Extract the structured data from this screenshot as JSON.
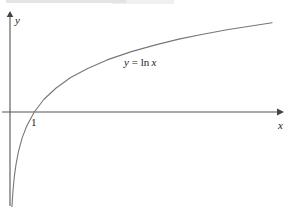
{
  "figure": {
    "background_color": "#ffffff",
    "ink_color": "#555555",
    "text_color": "#1a1a1a"
  },
  "labels": {
    "y_axis": "y",
    "x_axis": "x",
    "tick_one": "1",
    "curve_var": "y",
    "curve_equals": "=",
    "curve_func": "ln",
    "curve_arg": "x",
    "curve_full": "y = ln x"
  },
  "chart_data": {
    "type": "line",
    "title": "",
    "subtitle": "",
    "xlabel": "x",
    "ylabel": "y",
    "legend": [
      "y = ln x"
    ],
    "annotations": [
      {
        "text": "y = ln x",
        "x": 4.9,
        "y": 1.6
      },
      {
        "text": "1",
        "x": 1.0,
        "y": -0.25
      }
    ],
    "grid": false,
    "legend_position": "inline-annotation",
    "xlim": [
      -0.2,
      11.0
    ],
    "ylim": [
      -4.0,
      2.6
    ],
    "x_intercept": 1.0,
    "series": [
      {
        "name": "y = ln x",
        "x": [
          0.03,
          0.05,
          0.08,
          0.12,
          0.18,
          0.25,
          0.35,
          0.5,
          0.7,
          1.0,
          1.4,
          1.9,
          2.5,
          3.2,
          4.0,
          5.0,
          6.0,
          7.0,
          8.0,
          9.0,
          10.0,
          10.8
        ],
        "y": [
          -3.51,
          -3.0,
          -2.53,
          -2.12,
          -1.71,
          -1.39,
          -1.05,
          -0.69,
          -0.36,
          0.0,
          0.34,
          0.64,
          0.92,
          1.16,
          1.39,
          1.61,
          1.79,
          1.95,
          2.08,
          2.2,
          2.3,
          2.38
        ]
      }
    ]
  },
  "axes": {
    "y_axis_has_arrow": true,
    "x_axis_has_arrow": true
  }
}
